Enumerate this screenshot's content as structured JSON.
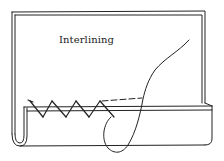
{
  "diagram": {
    "label": "Interlining",
    "stroke_color": "#222222",
    "background": "#ffffff",
    "elements": [
      "interlining-panel",
      "folded-hem",
      "catch-stitches",
      "needle-thread"
    ]
  }
}
